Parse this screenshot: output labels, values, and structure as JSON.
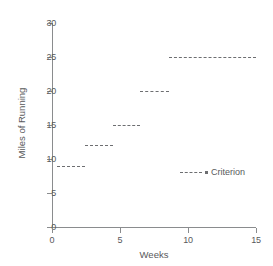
{
  "chart_data": {
    "type": "line",
    "subtype": "step-criterion",
    "title": "",
    "xlabel": "Weeks",
    "ylabel": "Miles of Running",
    "xlim": [
      0,
      15
    ],
    "ylim": [
      0,
      30
    ],
    "xticks": [
      0,
      5,
      10,
      15
    ],
    "yticks": [
      0,
      5,
      10,
      15,
      20,
      25,
      30
    ],
    "xtick_labels": [
      "0",
      "5",
      "10",
      "15"
    ],
    "ytick_labels": [
      "0",
      "5",
      "10",
      "15",
      "20",
      "25",
      "30"
    ],
    "grid": false,
    "legend": {
      "position": "inside-right",
      "entries": [
        {
          "name": "Criterion",
          "style": "dashed",
          "color": "#6d6e71"
        }
      ]
    },
    "series": [
      {
        "name": "Criterion",
        "style": "dashed",
        "color": "#6d6e71",
        "segments": [
          {
            "x_start": 0.4,
            "x_end": 2.4,
            "value": 9
          },
          {
            "x_start": 2.4,
            "x_end": 4.5,
            "value": 12
          },
          {
            "x_start": 4.5,
            "x_end": 6.5,
            "value": 15
          },
          {
            "x_start": 6.5,
            "x_end": 8.6,
            "value": 20
          },
          {
            "x_start": 8.6,
            "x_end": 15.0,
            "value": 25
          }
        ]
      }
    ],
    "annotations": []
  },
  "legend": {
    "criterion_label": "Criterion"
  },
  "axes": {
    "x_title": "Weeks",
    "y_title": "Miles of Running"
  }
}
